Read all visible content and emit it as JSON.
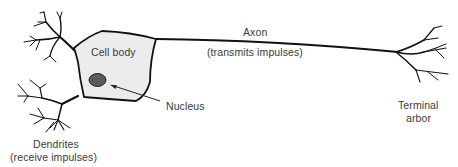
{
  "diagram": {
    "colors": {
      "stroke": "#111111",
      "cell_fill": "#ececec",
      "nucleus_fill": "#5a5a5a",
      "label_text": "#3a3a3a",
      "background": "#ffffff"
    },
    "parts": {
      "cell_body": {
        "label": "Cell body"
      },
      "nucleus": {
        "label": "Nucleus"
      },
      "axon": {
        "label": "Axon",
        "function": "(transmits impulses)"
      },
      "terminal_arbor": {
        "label_line1": "Terminal",
        "label_line2": "arbor"
      },
      "dendrites": {
        "label": "Dendrites",
        "function": "(receive impulses)"
      }
    }
  }
}
